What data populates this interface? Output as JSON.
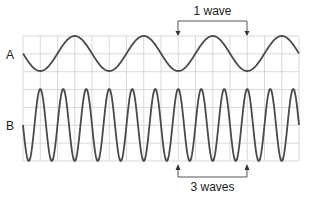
{
  "diagram": {
    "wave_a": {
      "label": "A",
      "period_px": 69,
      "amplitude_px": 17.5,
      "center_y": 53.5
    },
    "wave_b": {
      "label": "B",
      "period_px": 23,
      "amplitude_px": 36,
      "center_y": 125
    },
    "annotations": {
      "top": "1 wave",
      "bottom": "3 waves"
    },
    "colors": {
      "wave": "#4a4a4a",
      "grid": "#cfcfcf",
      "bracket": "#555555"
    }
  }
}
